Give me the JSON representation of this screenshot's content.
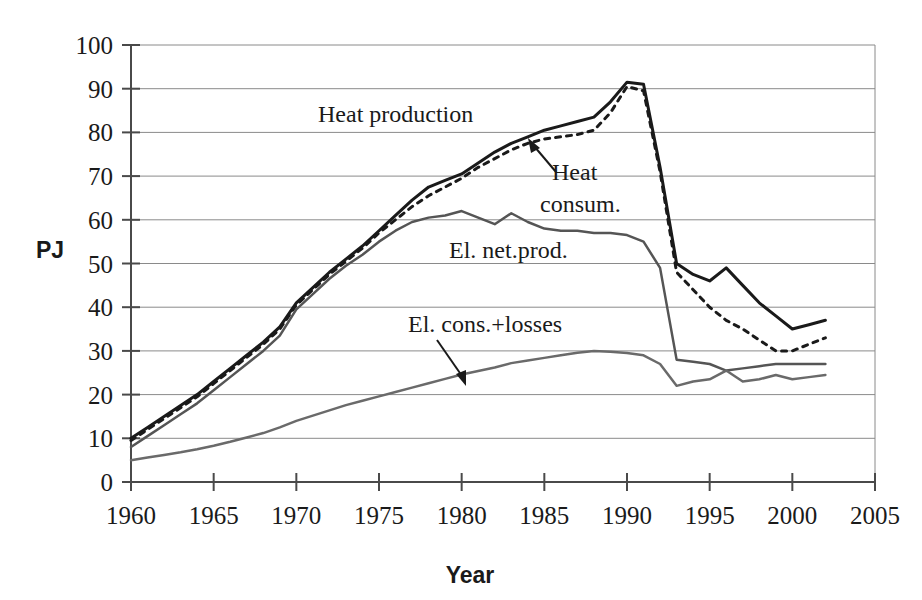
{
  "chart_data": {
    "type": "line",
    "title": "",
    "xlabel": "Year",
    "ylabel": "PJ",
    "xlim": [
      1960,
      2005
    ],
    "ylim": [
      0,
      100
    ],
    "xticks": [
      1960,
      1965,
      1970,
      1975,
      1980,
      1985,
      1990,
      1995,
      2000,
      2005
    ],
    "yticks": [
      0,
      10,
      20,
      30,
      40,
      50,
      60,
      70,
      80,
      90,
      100
    ],
    "grid": "horizontal",
    "legend": "inline-annotations",
    "x": [
      1960,
      1961,
      1962,
      1963,
      1964,
      1965,
      1966,
      1967,
      1968,
      1969,
      1970,
      1971,
      1972,
      1973,
      1974,
      1975,
      1976,
      1977,
      1978,
      1979,
      1980,
      1981,
      1982,
      1983,
      1984,
      1985,
      1986,
      1987,
      1988,
      1989,
      1990,
      1991,
      1992,
      1993,
      1994,
      1995,
      1996,
      1997,
      1998,
      1999,
      2000,
      2001,
      2002
    ],
    "series": [
      {
        "name": "Heat production",
        "style": "solid",
        "color": "#1a1a1a",
        "width": 3,
        "values": [
          10.0,
          12.5,
          15.0,
          17.5,
          20.0,
          23.0,
          26.0,
          29.0,
          32.0,
          35.5,
          41.0,
          44.5,
          48.0,
          51.0,
          54.0,
          57.5,
          61.0,
          64.5,
          67.5,
          69.0,
          70.5,
          73.0,
          75.5,
          77.5,
          79.0,
          80.5,
          81.5,
          82.5,
          83.5,
          87.0,
          91.5,
          91.0,
          72.0,
          50.0,
          47.5,
          46.0,
          49.0,
          45.0,
          41.0,
          38.0,
          35.0,
          36.0,
          37.0
        ]
      },
      {
        "name": "Heat consum.",
        "style": "dotted",
        "color": "#1a1a1a",
        "width": 3,
        "values": [
          9.5,
          12.0,
          14.5,
          17.0,
          19.5,
          22.5,
          25.5,
          28.5,
          31.5,
          35.0,
          40.5,
          44.0,
          47.5,
          50.5,
          53.5,
          57.0,
          60.0,
          63.0,
          65.5,
          67.5,
          69.5,
          72.0,
          74.0,
          76.0,
          77.5,
          78.5,
          79.0,
          79.5,
          80.5,
          84.5,
          90.5,
          89.5,
          71.0,
          48.0,
          44.0,
          40.0,
          37.0,
          35.0,
          32.5,
          30.0,
          30.0,
          31.5,
          33.0
        ]
      },
      {
        "name": "El. net.prod.",
        "style": "solid",
        "color": "#555555",
        "width": 2.5,
        "values": [
          8.0,
          10.5,
          13.0,
          15.5,
          18.0,
          21.0,
          24.0,
          27.0,
          30.0,
          33.5,
          39.5,
          43.0,
          46.5,
          49.5,
          52.0,
          55.0,
          57.5,
          59.5,
          60.5,
          61.0,
          62.0,
          60.5,
          59.0,
          61.5,
          59.5,
          58.0,
          57.5,
          57.5,
          57.0,
          57.0,
          56.5,
          55.0,
          49.0,
          28.0,
          27.5,
          27.0,
          25.5,
          26.0,
          26.5,
          27.0,
          27.0,
          27.0,
          27.0
        ]
      },
      {
        "name": "El. cons.+losses",
        "style": "solid",
        "color": "#6a6a6a",
        "width": 2.5,
        "values": [
          5.0,
          5.6,
          6.2,
          6.8,
          7.5,
          8.3,
          9.2,
          10.2,
          11.2,
          12.5,
          14.0,
          15.2,
          16.4,
          17.6,
          18.6,
          19.6,
          20.6,
          21.6,
          22.6,
          23.6,
          24.6,
          25.4,
          26.2,
          27.2,
          27.8,
          28.4,
          29.0,
          29.6,
          30.0,
          29.8,
          29.5,
          29.0,
          27.0,
          22.0,
          23.0,
          23.5,
          25.5,
          23.0,
          23.5,
          24.5,
          23.5,
          24.0,
          24.5
        ]
      }
    ],
    "annotations": [
      {
        "name": "heat-production-label",
        "text": "Heat production"
      },
      {
        "name": "heat-consum-label",
        "text": "Heat consum.",
        "line1": "Heat",
        "line2": "consum.",
        "arrow": true
      },
      {
        "name": "el-net-prod-label",
        "text": "El. net.prod."
      },
      {
        "name": "el-cons-losses-label",
        "text": "El. cons.+losses",
        "arrow": true
      }
    ]
  },
  "axes": {
    "y_title": "PJ",
    "x_title": "Year",
    "y_labels": [
      "100",
      "90",
      "80",
      "70",
      "60",
      "50",
      "40",
      "30",
      "20",
      "10",
      "0"
    ],
    "x_labels": [
      "1960",
      "1965",
      "1970",
      "1975",
      "1980",
      "1985",
      "1990",
      "1995",
      "2000",
      "2005"
    ]
  },
  "colors": {
    "background": "#ffffff",
    "ink": "#1a1a1a",
    "grid": "#8a8a8a",
    "series_secondary": "#6a6a6a"
  }
}
